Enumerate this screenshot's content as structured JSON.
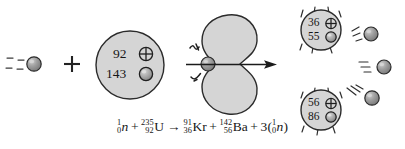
{
  "figure": {
    "background_color": "#ffffff",
    "nucleus_fill": "#d5d5d5",
    "nucleus_stroke": "#2b2b2b",
    "particle_fill": "#8f8f8f",
    "particle_stroke": "#2b2b2b",
    "text_color": "#161616"
  },
  "reactants": {
    "incoming_neutron": {
      "label": "incoming-neutron",
      "motion_lines": 4
    },
    "plus_sign": "+",
    "uranium_nucleus": {
      "label": "uranium-235-nucleus",
      "proton_count": "92",
      "proton_symbol": "⊕",
      "neutron_count": "143",
      "neutron_symbol": "◉"
    }
  },
  "intermediate": {
    "label": "deformed-compound-nucleus",
    "impact_neutron": "struck-neutron",
    "impact_marks": "impact-squiggles",
    "arrow": "fission-direction-arrow"
  },
  "products": {
    "krypton_fragment": {
      "label": "krypton-91-fragment",
      "proton_count": "36",
      "proton_symbol": "⊕",
      "neutron_count": "55",
      "neutron_symbol": "◉"
    },
    "barium_fragment": {
      "label": "barium-142-fragment",
      "proton_count": "56",
      "proton_symbol": "⊕",
      "neutron_count": "86",
      "neutron_symbol": "◉"
    },
    "released_neutrons": [
      {
        "label": "released-neutron-1"
      },
      {
        "label": "released-neutron-2"
      },
      {
        "label": "released-neutron-3"
      }
    ]
  },
  "equation": {
    "text": "¹₀n + ²³⁵₉₂U → ⁹¹₃₆Kr + ¹⁴²₅₆Ba + 3(¹₀n)",
    "terms": {
      "neutron_mass": "1",
      "neutron_charge": "0",
      "neutron_symbol": "n",
      "plus_1": "+",
      "uranium_mass": "235",
      "uranium_charge": "92",
      "uranium_symbol": "U",
      "arrow": "→",
      "krypton_mass": "91",
      "krypton_charge": "36",
      "krypton_symbol": "Kr",
      "plus_2": "+",
      "barium_mass": "142",
      "barium_charge": "56",
      "barium_symbol": "Ba",
      "plus_3": "+",
      "coefficient": "3",
      "paren_open": "(",
      "out_neutron_mass": "1",
      "out_neutron_charge": "0",
      "out_neutron_symbol": "n",
      "paren_close": ")"
    }
  }
}
